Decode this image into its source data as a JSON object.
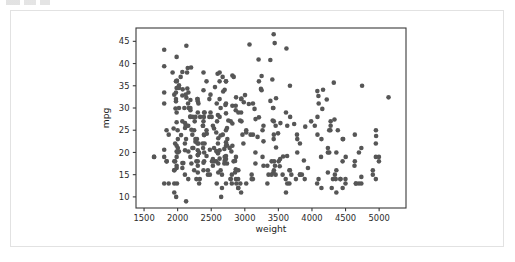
{
  "window": {
    "background_color": "#ffffff",
    "card_border_color": "#e2e2e2",
    "artifact_label": ""
  },
  "chart_data": {
    "type": "scatter",
    "title": "",
    "xlabel": "weight",
    "ylabel": "mpg",
    "xlim": [
      1380,
      5400
    ],
    "ylim": [
      7.5,
      48
    ],
    "xticks": [
      1500,
      2000,
      2500,
      3000,
      3500,
      4000,
      4500,
      5000
    ],
    "xtick_labels": [
      "1500",
      "2000",
      "2500",
      "3000",
      "3500",
      "4000",
      "4500",
      "5000"
    ],
    "yticks": [
      10,
      15,
      20,
      25,
      30,
      35,
      40,
      45
    ],
    "ytick_labels": [
      "10",
      "15",
      "20",
      "25",
      "30",
      "35",
      "40",
      "45"
    ],
    "grid": false,
    "legend": null,
    "marker_color": "#565656",
    "marker_size": 2.3,
    "series_name": "auto-mpg",
    "x": [
      3504,
      3693,
      3436,
      3433,
      3449,
      4341,
      4354,
      4312,
      4425,
      3850,
      3563,
      3609,
      3353,
      3761,
      3086,
      2372,
      2833,
      2774,
      2587,
      2130,
      1835,
      2672,
      2430,
      2375,
      2234,
      2648,
      1978,
      1950,
      2126,
      2254,
      2226,
      4274,
      4385,
      4135,
      3672,
      4633,
      4502,
      4456,
      4422,
      2330,
      3892,
      4098,
      4294,
      4077,
      2933,
      2511,
      2979,
      2189,
      2395,
      2288,
      2506,
      2164,
      2100,
      4100,
      3672,
      3988,
      4042,
      3777,
      4952,
      4464,
      4363,
      4237,
      4735,
      4951,
      3821,
      3121,
      3278,
      2945,
      3021,
      2904,
      1950,
      4997,
      4906,
      4654,
      4499,
      2789,
      2279,
      2401,
      2379,
      2124,
      2310,
      2472,
      2265,
      4082,
      4278,
      1867,
      2158,
      2582,
      2868,
      3399,
      2660,
      2807,
      3664,
      3102,
      2875,
      2901,
      3336,
      1950,
      2451,
      1836,
      2542,
      3781,
      3632,
      3613,
      4141,
      4699,
      4457,
      4638,
      4257,
      2219,
      1963,
      2300,
      1649,
      2003,
      2125,
      2108,
      2246,
      2489,
      2391,
      2000,
      3264,
      3459,
      3432,
      3158,
      4363,
      4237,
      4735,
      4951,
      3821,
      3121,
      3278,
      2945,
      3021,
      2904,
      1950,
      4997,
      4906,
      4654,
      4499,
      2789,
      2279,
      2401,
      2379,
      2124,
      2310,
      2472,
      2265,
      4082,
      4278,
      1867,
      2158,
      2582,
      2868,
      3399,
      2660,
      2807,
      3664,
      3102,
      2875,
      2901,
      3336,
      1950,
      2451,
      1836,
      2542,
      3781,
      3632,
      3613,
      4141,
      4699,
      4457,
      4638,
      4257,
      2219,
      1963,
      2300,
      1649,
      2003,
      2125,
      2108,
      2246,
      2489,
      2391,
      2000,
      3264,
      3459,
      3432,
      3158,
      4363,
      4237,
      4735,
      4951,
      3821,
      3121,
      3278,
      2945,
      3021,
      2904,
      1950,
      2395,
      2575,
      2525,
      2735,
      2865,
      1975,
      2190,
      2815,
      2600,
      2720,
      1985,
      1800,
      1985,
      2070,
      1800,
      1990,
      2320,
      2300,
      2020,
      2430,
      2110,
      2160,
      2205,
      2300,
      2300,
      2480,
      2695,
      2625,
      2700,
      2720,
      2385,
      2855,
      2605,
      2640,
      2395,
      2575,
      2525,
      2735,
      2865,
      1975,
      2190,
      2815,
      2600,
      2720,
      1985,
      1800,
      1985,
      2070,
      1800,
      1990,
      2320,
      2300,
      2020,
      2430,
      2110,
      2160,
      2205,
      2300,
      2300,
      2480,
      2695,
      2625,
      2700,
      2720,
      2385,
      2855,
      2605,
      2640,
      3160,
      3415,
      3060,
      3465,
      2605,
      2640,
      2395,
      2575,
      2525,
      2735,
      2865,
      1975,
      2190,
      2815,
      2600,
      2720,
      1985,
      1800,
      1985,
      2070,
      3940,
      3880,
      3520,
      3425,
      3630,
      3525,
      4220,
      4165,
      4325,
      4335,
      1940,
      2740,
      2755,
      2051,
      2075,
      1985,
      2190,
      2815,
      2600,
      2720,
      1985,
      1800,
      1985,
      2070,
      2950,
      3250,
      3675,
      3735,
      3495,
      3570,
      3240,
      3145,
      2985,
      2835,
      3465,
      3430,
      3210,
      3380,
      3070,
      3620,
      3410,
      3425,
      3445,
      3205,
      4080,
      4154,
      4096,
      4955,
      4746,
      5140,
      2930,
      3530,
      3900,
      3190,
      3420,
      2200,
      2150,
      2020,
      2130,
      2670,
      2595,
      2700,
      2556,
      2144,
      1968,
      2120,
      2019,
      2678,
      2870,
      3003,
      3381,
      2188,
      2711,
      2542,
      2434,
      2265,
      2110,
      2800,
      2085,
      2335,
      2950,
      3250,
      1800,
      1985,
      2070,
      2965,
      3430,
      3210,
      2045,
      2155,
      1925,
      1975,
      2625,
      2720,
      2385,
      2140,
      2295,
      2625,
      2720,
      2385,
      2130,
      2295,
      2625,
      2720,
      2385,
      2790,
      2130,
      2295,
      2625,
      2720,
      2385
    ],
    "y": [
      18.0,
      15.0,
      18.0,
      16.0,
      17.0,
      15.0,
      14.0,
      14.0,
      14.0,
      15.0,
      15.0,
      14.0,
      15.0,
      14.0,
      24.0,
      22.0,
      18.0,
      21.0,
      27.0,
      26.0,
      25.0,
      24.0,
      25.0,
      26.0,
      21.0,
      10.0,
      10.0,
      11.0,
      9.0,
      27.0,
      28.0,
      25.0,
      25.0,
      19.0,
      16.0,
      17.0,
      19.0,
      18.0,
      14.0,
      14.0,
      14.0,
      14.0,
      12.0,
      13.0,
      13.0,
      18.0,
      22.0,
      19.0,
      18.0,
      23.0,
      28.0,
      30.0,
      30.0,
      31.0,
      35.0,
      27.0,
      26.0,
      24.0,
      25.0,
      23.0,
      20.0,
      21.0,
      13.0,
      14.0,
      15.0,
      14.0,
      17.0,
      11.0,
      13.0,
      12.0,
      13.0,
      19.0,
      15.0,
      13.0,
      13.0,
      14.0,
      18.0,
      22.0,
      21.0,
      26.0,
      22.0,
      28.0,
      23.0,
      28.0,
      27.0,
      13.0,
      14.0,
      13.0,
      14.0,
      15.0,
      12.0,
      13.0,
      13.0,
      14.0,
      13.0,
      12.0,
      13.0,
      18.0,
      16.0,
      18.0,
      18.0,
      23.0,
      26.0,
      11.0,
      12.0,
      13.0,
      12.0,
      18.0,
      20.0,
      21.0,
      22.0,
      18.0,
      19.0,
      21.0,
      26.0,
      15.0,
      16.0,
      29.0,
      24.0,
      20.0,
      19.0,
      15.0,
      24.0,
      20.0,
      11.0,
      20.0,
      21.0,
      19.0,
      15.0,
      31.0,
      26.0,
      32.0,
      25.0,
      16.0,
      16.0,
      18.0,
      16.0,
      13.0,
      14.0,
      14.0,
      14.0,
      29.0,
      26.0,
      26.0,
      31.0,
      32.0,
      28.0,
      24.0,
      26.0,
      24.0,
      26.0,
      31.0,
      19.0,
      18.0,
      15.0,
      15.0,
      16.0,
      15.0,
      16.0,
      14.0,
      17.0,
      16.0,
      15.0,
      18.0,
      21.0,
      20.0,
      13.0,
      29.0,
      23.0,
      20.0,
      23.0,
      24.0,
      25.0,
      24.0,
      18.0,
      29.0,
      19.0,
      23.0,
      23.0,
      22.0,
      25.0,
      33.0,
      28.0,
      25.0,
      25.0,
      26.0,
      27.0,
      17.5,
      16.0,
      15.5,
      14.5,
      22.0,
      22.0,
      24.0,
      22.5,
      29.0,
      24.5,
      29.0,
      33.0,
      20.0,
      18.0,
      18.5,
      17.5,
      29.5,
      32.0,
      28.0,
      26.5,
      20.0,
      13.0,
      19.0,
      19.0,
      16.5,
      16.5,
      13.0,
      13.0,
      13.0,
      31.5,
      30.0,
      36.0,
      25.5,
      33.5,
      17.5,
      17.0,
      15.5,
      15.0,
      17.5,
      20.5,
      19.0,
      18.5,
      16.0,
      15.5,
      15.5,
      16.0,
      29.0,
      24.5,
      26.0,
      25.5,
      30.5,
      33.5,
      30.0,
      30.5,
      22.0,
      21.5,
      21.5,
      43.1,
      36.1,
      32.8,
      39.4,
      36.1,
      19.9,
      19.4,
      20.2,
      19.2,
      20.5,
      20.2,
      25.1,
      20.5,
      19.4,
      20.6,
      20.8,
      18.6,
      18.1,
      19.2,
      17.7,
      18.1,
      17.5,
      30.0,
      27.5,
      27.2,
      30.9,
      21.1,
      23.2,
      23.8,
      23.9,
      20.3,
      17.0,
      21.6,
      16.2,
      31.5,
      29.5,
      21.5,
      19.8,
      22.3,
      20.2,
      20.6,
      17.0,
      17.6,
      16.5,
      18.2,
      16.9,
      15.5,
      19.2,
      18.5,
      31.9,
      34.1,
      35.7,
      27.4,
      25.4,
      23.0,
      27.2,
      23.9,
      34.2,
      34.5,
      31.8,
      37.3,
      28.4,
      28.8,
      26.8,
      33.5,
      41.5,
      38.1,
      32.1,
      37.2,
      28.0,
      26.4,
      24.3,
      19.1,
      34.3,
      29.8,
      31.3,
      37.0,
      32.2,
      46.6,
      27.9,
      40.8,
      44.3,
      43.4,
      36.4,
      30.0,
      44.6,
      40.9,
      33.8,
      29.8,
      32.7,
      23.7,
      35.0,
      32.4,
      27.2,
      26.6,
      25.8,
      23.5,
      30.0,
      39.1,
      39.0,
      35.1,
      32.3,
      37.0,
      37.7,
      34.1,
      34.7,
      34.4,
      29.9,
      33.0,
      34.5,
      33.7,
      32.4,
      32.9,
      31.6,
      28.1,
      30.7,
      25.4,
      24.2,
      22.4,
      26.6,
      20.2,
      17.6,
      28.0,
      27.0,
      34.0,
      31.0,
      29.0,
      27.0,
      24.0,
      23.0,
      36.0,
      37.0,
      31.0,
      38.0,
      36.0,
      36.0,
      36.0,
      34.0,
      38.0,
      32.0,
      38.0,
      25.0,
      38.0,
      26.0,
      22.0,
      32.0,
      36.0,
      27.0,
      27.0,
      44.0,
      32.0,
      28.0,
      31.0
    ]
  }
}
